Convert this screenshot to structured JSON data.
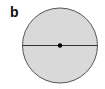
{
  "figure": {
    "label": "b",
    "circle": {
      "cx": 60,
      "cy": 45.5,
      "r": 37.5,
      "fill": "#d9d9d9",
      "stroke": "#555555"
    },
    "diameter": {
      "x1": 22.5,
      "x2": 97.5,
      "y": 45.5,
      "stroke": "#333333"
    },
    "center_point": {
      "cx": 60,
      "cy": 45.5,
      "r": 2.2,
      "fill": "#000000"
    }
  }
}
